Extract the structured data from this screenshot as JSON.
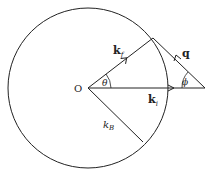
{
  "diagram": {
    "origin_label": "O",
    "kf": {
      "label": "k",
      "sub": "f"
    },
    "ki": {
      "label": "k",
      "sub": "i"
    },
    "q": {
      "label": "q"
    },
    "theta": {
      "label": "θ"
    },
    "phi": {
      "label": "ϕ"
    },
    "kB": {
      "label": "k",
      "sub": "B"
    },
    "stroke_color": "#222222"
  }
}
